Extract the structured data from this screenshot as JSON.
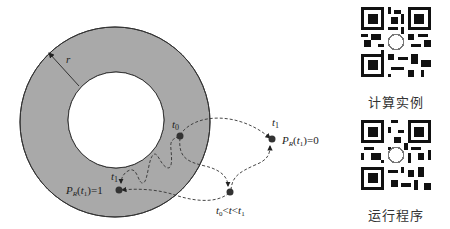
{
  "diagram": {
    "radius_label": "r",
    "point_start": {
      "label": "t",
      "sub": "0"
    },
    "point_outside": {
      "label": "t",
      "sub": "1",
      "prob": {
        "P": "P",
        "sub": "R",
        "arg_t": "t",
        "arg_sub": "1",
        "value": "=0"
      }
    },
    "point_inside": {
      "label": "t",
      "sub": "1",
      "prob": {
        "P": "P",
        "sub": "R",
        "arg_t": "t",
        "arg_sub": "1",
        "value": "=1"
      }
    },
    "point_mid": {
      "label_t0": "t",
      "label_t0_sub": "0",
      "lt1": "<",
      "t": "t",
      "lt2": "<",
      "label_t1": "t",
      "label_t1_sub": "1"
    },
    "colors": {
      "annulus_fill": "#a9a9a9",
      "stroke": "#333333",
      "point": "#333333"
    }
  },
  "qr_codes": [
    {
      "label": "计算实例"
    },
    {
      "label": "运行程序"
    }
  ]
}
